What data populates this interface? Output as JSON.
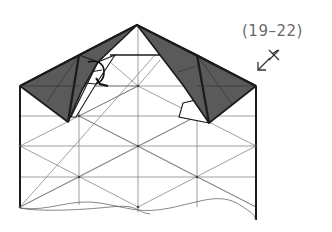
{
  "step": {
    "label": "(19–22)"
  },
  "symbols": {
    "turn_over": "arrow-with-x-icon",
    "fold_arrow": "curved-fold-arrow-icon"
  },
  "colors": {
    "shaded_paper": "#5a5a5a",
    "line": "#1a1a1a",
    "grid": "#777777",
    "label": "#6a6a6a"
  },
  "geometry": {
    "apex": [
      137,
      25
    ],
    "left_corner": [
      20,
      86
    ],
    "right_corner": [
      256,
      86
    ],
    "left_tip": [
      68,
      122
    ],
    "right_tip": [
      209,
      123
    ],
    "grid_rows_y": [
      86,
      116,
      146,
      177,
      208
    ],
    "grid_cols_x": [
      20,
      79,
      138,
      197,
      256
    ]
  }
}
